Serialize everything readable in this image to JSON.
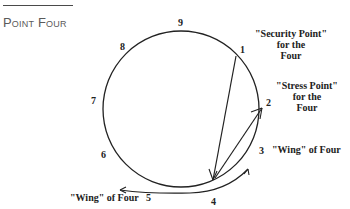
{
  "heading": "Point Four",
  "diagram": {
    "points": [
      {
        "n": "1"
      },
      {
        "n": "2"
      },
      {
        "n": "3"
      },
      {
        "n": "4"
      },
      {
        "n": "5"
      },
      {
        "n": "6"
      },
      {
        "n": "7"
      },
      {
        "n": "8"
      },
      {
        "n": "9"
      }
    ],
    "labels": {
      "security": [
        "\"Security Point\"",
        "for the",
        "Four"
      ],
      "stress": [
        "\"Stress Point\"",
        "for the",
        "Four"
      ],
      "wing_right": "\"Wing\" of Four",
      "wing_left": "\"Wing\" of Four"
    },
    "arrows": [
      {
        "from": "1",
        "to": "4",
        "meaning": "security point"
      },
      {
        "from": "4",
        "to": "2",
        "meaning": "stress point"
      },
      {
        "from": "4",
        "to": "3",
        "meaning": "wing"
      },
      {
        "from": "4",
        "to": "5",
        "meaning": "wing"
      }
    ]
  }
}
